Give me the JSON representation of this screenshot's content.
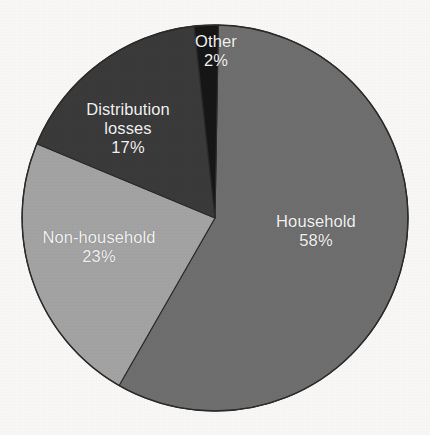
{
  "chart_data": {
    "type": "pie",
    "title": "",
    "subtitle": "",
    "xlabel": "",
    "ylabel": "",
    "legend_position": "none",
    "grid": false,
    "units": "%",
    "start_angle_deg": 1,
    "direction": "clockwise",
    "categories": [
      "Household",
      "Non-household",
      "Distribution losses",
      "Other"
    ],
    "values": [
      58,
      23,
      17,
      2
    ],
    "labels": [
      "58%",
      "23%",
      "17%",
      "2%"
    ],
    "colors": [
      "#6e6e6e",
      "#a3a3a3",
      "#3a3a3a",
      "#161616"
    ],
    "slices": [
      {
        "name": "Household",
        "value": 58,
        "value_label": "58%",
        "color": "#6e6e6e",
        "label_color": "#f2f2f2"
      },
      {
        "name": "Non-household",
        "value": 23,
        "value_label": "23%",
        "color": "#a3a3a3",
        "label_color": "#f2f2f2"
      },
      {
        "name": "Distribution losses",
        "name_line1": "Distribution",
        "name_line2": "losses",
        "value": 17,
        "value_label": "17%",
        "color": "#3a3a3a",
        "label_color": "#f2f2f2"
      },
      {
        "name": "Other",
        "value": 2,
        "value_label": "2%",
        "color": "#161616",
        "label_color": "#f2f2f2"
      }
    ]
  },
  "figure": {
    "background_color": "#f8f7f5",
    "outline_color": "#2a2a2a",
    "center_x": 215,
    "center_y": 218,
    "radius": 193
  }
}
